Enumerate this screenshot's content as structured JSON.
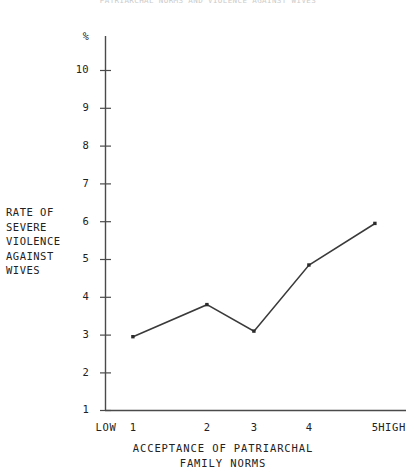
{
  "clipped_header": {
    "text": "PATRIARCHAL NORMS AND VIOLENCE AGAINST WIVES"
  },
  "chart_data": {
    "type": "line",
    "title": "",
    "subtitle": "",
    "xlabel": "ACCEPTANCE OF PATRIARCHAL\nFAMILY NORMS",
    "ylabel": "RATE OF\nSEVERE\nVIOLENCE\nAGAINST\nWIVES",
    "y_unit": "%",
    "categories": [
      "1",
      "2",
      "3",
      "4",
      "5"
    ],
    "x_end_labels": {
      "low": "LOW",
      "high": "HIGH"
    },
    "values": [
      2.95,
      3.8,
      3.1,
      4.85,
      5.95
    ],
    "xtick_labels": [
      "1",
      "2",
      "3",
      "4",
      "5"
    ],
    "ytick_labels": [
      "10",
      "9",
      "8",
      "7",
      "6",
      "5",
      "4",
      "3",
      "2",
      "1"
    ],
    "ytick_values": [
      10,
      9,
      8,
      7,
      6,
      5,
      4,
      3,
      2,
      1
    ],
    "ylim": [
      1,
      10
    ],
    "xlim": [
      1,
      5
    ],
    "grid": false,
    "legend": false,
    "legend_position": "none",
    "marker": "square-dot",
    "line_color": "#3a3a3a",
    "axis_color": "#4a4a4a",
    "background_color": "#ffffff"
  }
}
